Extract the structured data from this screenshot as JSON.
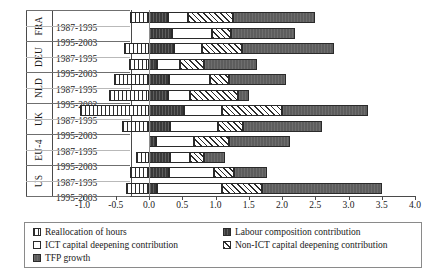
{
  "chart_data": {
    "type": "bar",
    "orientation": "horizontal",
    "stacked": true,
    "title": "",
    "xlabel": "",
    "ylabel": "",
    "xlim": [
      -1.0,
      4.0
    ],
    "xticks": [
      "-1.0",
      "-0.5",
      "0.0",
      "0.5",
      "1.0",
      "1.5",
      "2.0",
      "2.5",
      "3.0",
      "3.5",
      "4.0"
    ],
    "xtick_values": [
      -1.0,
      -0.5,
      0.0,
      0.5,
      1.0,
      1.5,
      2.0,
      2.5,
      3.0,
      3.5,
      4.0
    ],
    "grid": false,
    "legend_position": "bottom",
    "groups": [
      "FRA",
      "DEU",
      "NLD",
      "UK",
      "EU-4",
      "US"
    ],
    "periods": [
      "1987-1995",
      "1995-2003"
    ],
    "series": [
      {
        "name": "Reallocation of hours",
        "key": "realloc",
        "values": [
          -0.28,
          0.0,
          -0.38,
          -0.3,
          -0.52,
          -0.6,
          -1.04,
          -0.4,
          0.0,
          -0.2,
          -0.28,
          -0.34
        ]
      },
      {
        "name": "Labour composition contribution",
        "key": "labour",
        "values": [
          0.28,
          0.35,
          0.38,
          0.12,
          0.3,
          0.28,
          0.52,
          0.32,
          0.1,
          0.32,
          0.3,
          0.12
        ]
      },
      {
        "name": "ICT capital deepening contribution",
        "key": "ict",
        "values": [
          0.3,
          0.6,
          0.42,
          0.34,
          0.62,
          0.34,
          0.58,
          0.72,
          0.58,
          0.3,
          0.68,
          0.98
        ]
      },
      {
        "name": "Non-ICT capital deepening contribution",
        "key": "nonict",
        "values": [
          0.68,
          0.28,
          0.6,
          0.36,
          0.28,
          0.72,
          0.9,
          0.38,
          0.52,
          0.2,
          0.3,
          0.6
        ]
      },
      {
        "name": "TFP growth",
        "key": "tfp",
        "values": [
          1.24,
          0.96,
          1.38,
          0.8,
          0.86,
          0.16,
          1.3,
          1.18,
          0.92,
          0.32,
          0.5,
          1.8
        ]
      }
    ],
    "rows": [
      {
        "group": "FRA",
        "period": "1987-1995",
        "realloc": -0.28,
        "labour": 0.28,
        "ict": 0.3,
        "nonict": 0.68,
        "tfp": 1.24
      },
      {
        "group": "FRA",
        "period": "1995-2003",
        "realloc": 0.0,
        "labour": 0.35,
        "ict": 0.6,
        "nonict": 0.28,
        "tfp": 0.96
      },
      {
        "group": "DEU",
        "period": "1987-1995",
        "realloc": -0.38,
        "labour": 0.38,
        "ict": 0.42,
        "nonict": 0.6,
        "tfp": 1.38
      },
      {
        "group": "DEU",
        "period": "1995-2003",
        "realloc": -0.3,
        "labour": 0.12,
        "ict": 0.34,
        "nonict": 0.36,
        "tfp": 0.8
      },
      {
        "group": "NLD",
        "period": "1987-1995",
        "realloc": -0.52,
        "labour": 0.3,
        "ict": 0.62,
        "nonict": 0.28,
        "tfp": 0.86
      },
      {
        "group": "NLD",
        "period": "1995-2003",
        "realloc": -0.6,
        "labour": 0.28,
        "ict": 0.34,
        "nonict": 0.72,
        "tfp": 0.16
      },
      {
        "group": "UK",
        "period": "1987-1995",
        "realloc": -1.04,
        "labour": 0.52,
        "ict": 0.58,
        "nonict": 0.9,
        "tfp": 1.3
      },
      {
        "group": "UK",
        "period": "1995-2003",
        "realloc": -0.4,
        "labour": 0.32,
        "ict": 0.72,
        "nonict": 0.38,
        "tfp": 1.18
      },
      {
        "group": "EU-4",
        "period": "1987-1995",
        "realloc": 0.0,
        "labour": 0.1,
        "ict": 0.58,
        "nonict": 0.52,
        "tfp": 0.92
      },
      {
        "group": "EU-4",
        "period": "1995-2003",
        "realloc": -0.2,
        "labour": 0.32,
        "ict": 0.3,
        "nonict": 0.2,
        "tfp": 0.32
      },
      {
        "group": "US",
        "period": "1987-1995",
        "realloc": -0.28,
        "labour": 0.3,
        "ict": 0.68,
        "nonict": 0.3,
        "tfp": 0.5
      },
      {
        "group": "US",
        "period": "1995-2003",
        "realloc": -0.34,
        "labour": 0.12,
        "ict": 0.98,
        "nonict": 0.6,
        "tfp": 1.8
      }
    ],
    "legend": [
      {
        "label": "Reallocation of hours",
        "key": "realloc"
      },
      {
        "label": "Labour composition contribution",
        "key": "labour"
      },
      {
        "label": "ICT capital deepening contribution",
        "key": "ict"
      },
      {
        "label": "Non-ICT capital deepening contribution",
        "key": "nonict"
      },
      {
        "label": "TFP growth",
        "key": "tfp"
      }
    ]
  }
}
